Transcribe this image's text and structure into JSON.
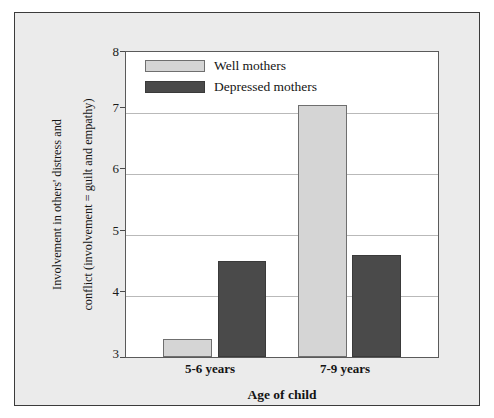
{
  "chart_data": {
    "type": "bar",
    "title": "",
    "xlabel": "Age of child",
    "ylabel": "Involvement in others' distress and conflict (involvement = guilt and empathy)",
    "ylabel_line1": "Involvement in others' distress and",
    "ylabel_line2": "conflict (involvement = guilt and empathy)",
    "categories": [
      "5-6 years",
      "7-9 years"
    ],
    "series": [
      {
        "name": "Well mothers",
        "values": [
          3.29,
          7.13
        ],
        "color": "#d5d5d5"
      },
      {
        "name": "Depressed mothers",
        "values": [
          4.58,
          4.68
        ],
        "color": "#4a4a4a"
      }
    ],
    "ylim": [
      3,
      8
    ],
    "yticks": [
      "3",
      "4",
      "5",
      "6",
      "7",
      "8"
    ],
    "ytick_values": [
      3,
      4,
      5,
      6,
      7,
      8
    ],
    "gridlines": [
      4,
      5,
      6,
      7
    ],
    "grid": true,
    "legend_position": "top-left"
  },
  "legend": {
    "entries": [
      {
        "label": "Well mothers",
        "swatch": "light"
      },
      {
        "label": "Depressed mothers",
        "swatch": "dark"
      }
    ]
  },
  "axes": {
    "y_ticks": [
      "3",
      "4",
      "5",
      "6",
      "7",
      "8"
    ],
    "x_ticks": [
      "5-6 years",
      "7-9 years"
    ],
    "x_title": "Age of child",
    "y_title_line1": "Involvement in others' distress and",
    "y_title_line2": "conflict (involvement = guilt and empathy)"
  },
  "colors": {
    "well_mothers": "#d5d5d5",
    "depressed_mothers": "#4a4a4a",
    "panel_background": "#ebebeb",
    "plot_background": "#ffffff",
    "gridline": "#b9b9b9",
    "frame": "#3b3b3b"
  }
}
